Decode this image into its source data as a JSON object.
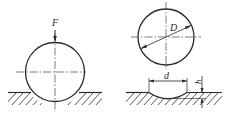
{
  "figure_left": {
    "label_force": "F",
    "description": "Ball pressed into surface by force F"
  },
  "figure_right": {
    "label_diameter_ball": "D",
    "label_indent_diameter": "d",
    "label_indent_depth": "h",
    "description": "Ball diameter D and resulting indentation diameter d, depth h"
  },
  "colors": {
    "line": "#2a2a2a",
    "background": "#ffffff"
  }
}
